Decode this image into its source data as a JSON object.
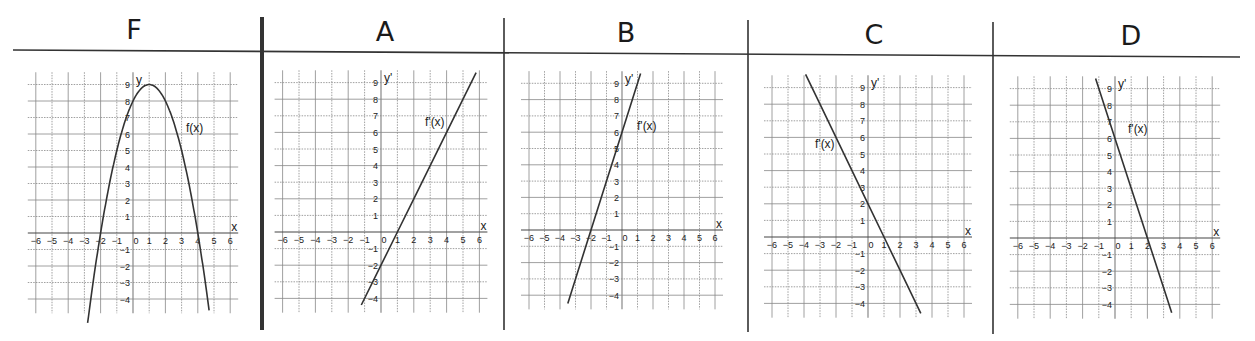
{
  "panels": [
    {
      "id": "F",
      "title": "F",
      "curve_label": "f(x)",
      "y_label": "y",
      "x_label": "x"
    },
    {
      "id": "A",
      "title": "A",
      "curve_label": "f'(x)",
      "y_label": "y'",
      "x_label": "x"
    },
    {
      "id": "B",
      "title": "B",
      "curve_label": "f'(x)",
      "y_label": "y'",
      "x_label": "x"
    },
    {
      "id": "C",
      "title": "C",
      "curve_label": "f'(x)",
      "y_label": "y'",
      "x_label": "x"
    },
    {
      "id": "D",
      "title": "D",
      "curve_label": "f'(x)",
      "y_label": "y'",
      "x_label": "x"
    }
  ],
  "colors": {
    "line": "#333333",
    "grid": "#888888",
    "divider": "#333333"
  },
  "chart_data": [
    {
      "type": "line",
      "title": "F",
      "series": [
        {
          "name": "f(x)",
          "formula": "-(x-1)^2+9",
          "x": [
            -2.8,
            -2,
            -1,
            0,
            1,
            2,
            3,
            4,
            4.7
          ],
          "y": [
            -5.4,
            0,
            5,
            8,
            9,
            8,
            5,
            0,
            -4.7
          ]
        }
      ],
      "xlabel": "x",
      "ylabel": "y",
      "xticks": [
        -6,
        -5,
        -4,
        -3,
        -2,
        -1,
        0,
        1,
        2,
        3,
        4,
        5,
        6
      ],
      "yticks": [
        -4,
        -3,
        -2,
        -1,
        1,
        2,
        3,
        4,
        5,
        6,
        7,
        8,
        9
      ],
      "xlim": [
        -6,
        6
      ],
      "ylim": [
        -4.5,
        9.5
      ],
      "grid": true
    },
    {
      "type": "line",
      "title": "A",
      "series": [
        {
          "name": "f'(x)",
          "formula": "2x-2",
          "x": [
            -1.2,
            0,
            1,
            2,
            3,
            4,
            5,
            5.8
          ],
          "y": [
            -4.4,
            -2,
            0,
            2,
            4,
            6,
            8,
            9.6
          ]
        }
      ],
      "xlabel": "x",
      "ylabel": "y'",
      "xticks": [
        -6,
        -5,
        -4,
        -3,
        -2,
        -1,
        0,
        1,
        2,
        3,
        4,
        5,
        6
      ],
      "yticks": [
        -4,
        -3,
        -2,
        -1,
        1,
        2,
        3,
        4,
        5,
        6,
        7,
        8,
        9
      ],
      "xlim": [
        -6,
        6
      ],
      "ylim": [
        -4.5,
        9.5
      ],
      "grid": true
    },
    {
      "type": "line",
      "title": "B",
      "series": [
        {
          "name": "f'(x)",
          "formula": "3x+6",
          "x": [
            -3.5,
            -3,
            -2,
            -1,
            0,
            1,
            1.2
          ],
          "y": [
            -4.5,
            -3,
            0,
            3,
            6,
            9,
            9.6
          ]
        }
      ],
      "xlabel": "x",
      "ylabel": "y'",
      "xticks": [
        -6,
        -5,
        -4,
        -3,
        -2,
        -1,
        0,
        1,
        2,
        3,
        4,
        5,
        6
      ],
      "yticks": [
        -4,
        -3,
        -2,
        -1,
        1,
        2,
        3,
        4,
        5,
        6,
        7,
        8,
        9
      ],
      "xlim": [
        -6,
        6
      ],
      "ylim": [
        -4.5,
        9.5
      ],
      "grid": true
    },
    {
      "type": "line",
      "title": "C",
      "series": [
        {
          "name": "f'(x)",
          "formula": "-2x+2",
          "x": [
            -3.9,
            -3,
            -2,
            -1,
            0,
            1,
            2,
            3,
            3.3
          ],
          "y": [
            9.8,
            8,
            6,
            4,
            2,
            0,
            -2,
            -4,
            -4.6
          ]
        }
      ],
      "xlabel": "x",
      "ylabel": "y'",
      "xticks": [
        -6,
        -5,
        -4,
        -3,
        -2,
        -1,
        0,
        1,
        2,
        3,
        4,
        5,
        6
      ],
      "yticks": [
        -4,
        -3,
        -2,
        -1,
        1,
        2,
        3,
        4,
        5,
        6,
        7,
        8,
        9
      ],
      "xlim": [
        -6,
        6
      ],
      "ylim": [
        -4.5,
        9.5
      ],
      "grid": true
    },
    {
      "type": "line",
      "title": "D",
      "series": [
        {
          "name": "f'(x)",
          "formula": "-3x+6",
          "x": [
            -1.2,
            0,
            1,
            2,
            3,
            3.5
          ],
          "y": [
            9.6,
            6,
            3,
            0,
            -3,
            -4.5
          ]
        }
      ],
      "xlabel": "x",
      "ylabel": "y'",
      "xticks": [
        -6,
        -5,
        -4,
        -3,
        -2,
        -1,
        0,
        1,
        2,
        3,
        4,
        5,
        6
      ],
      "yticks": [
        -4,
        -3,
        -2,
        -1,
        1,
        2,
        3,
        4,
        5,
        6,
        7,
        8,
        9
      ],
      "xlim": [
        -6,
        6
      ],
      "ylim": [
        -4.5,
        9.5
      ],
      "grid": true
    }
  ]
}
